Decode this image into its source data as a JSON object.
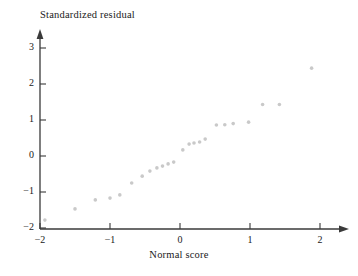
{
  "chart_data": {
    "type": "scatter",
    "title": "",
    "xlabel": "Normal score",
    "ylabel": "Standardized residual",
    "xlim": [
      -2.15,
      2.25
    ],
    "ylim": [
      -2.05,
      3.45
    ],
    "xticks": [
      -2,
      -1,
      0,
      1,
      2
    ],
    "xticklabels": [
      "−2",
      "−1",
      "0",
      "1",
      "2"
    ],
    "yticks": [
      -2,
      -1,
      0,
      1,
      2,
      3
    ],
    "yticklabels": [
      "−2",
      "−1",
      "0",
      "1",
      "2",
      "3"
    ],
    "grid": false,
    "legend": null,
    "marker": {
      "shape": "circle",
      "color": "#c9c9c9",
      "size_px": 3.6
    },
    "axis_color": "#3a3a3a",
    "text_color": "#1a1a1a",
    "background": "#ffffff",
    "series": [
      {
        "name": "Standardized residual vs normal score",
        "points": [
          {
            "x": -1.93,
            "y": -1.78
          },
          {
            "x": -1.5,
            "y": -1.47
          },
          {
            "x": -1.21,
            "y": -1.22
          },
          {
            "x": -1.0,
            "y": -1.17
          },
          {
            "x": -0.86,
            "y": -1.08
          },
          {
            "x": -0.69,
            "y": -0.75
          },
          {
            "x": -0.54,
            "y": -0.56
          },
          {
            "x": -0.43,
            "y": -0.42
          },
          {
            "x": -0.33,
            "y": -0.33
          },
          {
            "x": -0.25,
            "y": -0.28
          },
          {
            "x": -0.17,
            "y": -0.22
          },
          {
            "x": -0.09,
            "y": -0.17
          },
          {
            "x": 0.04,
            "y": 0.17
          },
          {
            "x": 0.13,
            "y": 0.33
          },
          {
            "x": 0.2,
            "y": 0.36
          },
          {
            "x": 0.28,
            "y": 0.39
          },
          {
            "x": 0.36,
            "y": 0.47
          },
          {
            "x": 0.52,
            "y": 0.86
          },
          {
            "x": 0.64,
            "y": 0.87
          },
          {
            "x": 0.76,
            "y": 0.9
          },
          {
            "x": 0.98,
            "y": 0.94
          },
          {
            "x": 1.18,
            "y": 1.43
          },
          {
            "x": 1.42,
            "y": 1.43
          },
          {
            "x": 1.88,
            "y": 2.44
          }
        ]
      }
    ]
  },
  "geometry": {
    "x_origin_px": 40,
    "y_zero_px": 156,
    "x_unit_px": 70,
    "y_unit_px": 36,
    "x_axis_y_px": 229,
    "x_axis_end_px": 348,
    "y_axis_top_px": 30
  }
}
